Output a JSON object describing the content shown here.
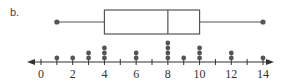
{
  "part_label": "b.",
  "colors": {
    "stroke": "#555555",
    "dot": "#555555",
    "axis": "#333333"
  },
  "chart_data": [
    {
      "type": "boxplot",
      "title": "",
      "min": 1,
      "q1": 4,
      "median": 8,
      "q3": 10,
      "max": 14
    },
    {
      "type": "scatter",
      "subtype": "dot-plot",
      "title": "",
      "xlabel": "",
      "ylabel": "",
      "xlim": [
        0,
        14
      ],
      "tick_labels": [
        "0",
        "2",
        "4",
        "6",
        "8",
        "10",
        "12",
        "14"
      ],
      "tick_values": [
        0,
        1,
        2,
        3,
        4,
        5,
        6,
        7,
        8,
        9,
        10,
        11,
        12,
        13,
        14
      ],
      "labeled_ticks": [
        0,
        2,
        4,
        6,
        8,
        10,
        12,
        14
      ],
      "x": [
        1,
        2,
        3,
        4,
        6,
        8,
        9,
        10,
        12,
        14
      ],
      "counts": [
        1,
        1,
        2,
        3,
        2,
        4,
        1,
        3,
        2,
        1
      ],
      "arrows": "both-ends",
      "grid": false
    }
  ]
}
